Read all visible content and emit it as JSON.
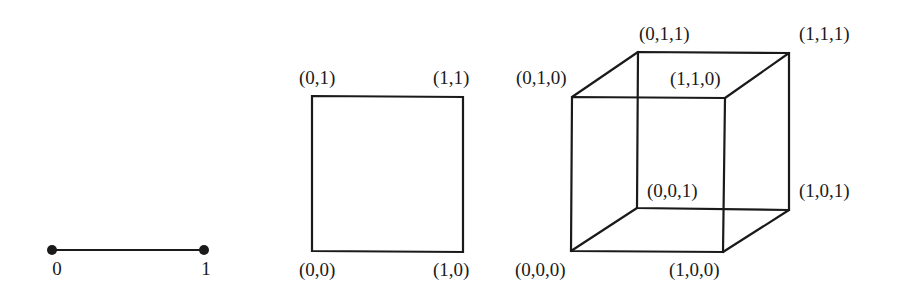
{
  "figures": {
    "line": {
      "vertices": [
        {
          "label": "0",
          "x": 52,
          "y": 250,
          "lx": 56,
          "ly": 272
        },
        {
          "label": "1",
          "x": 204,
          "y": 250,
          "lx": 204,
          "ly": 272
        }
      ]
    },
    "square": {
      "labels": {
        "v00": "(0,0)",
        "v10": "(1,0)",
        "v01": "(0,1)",
        "v11": "(1,1)"
      }
    },
    "cube": {
      "labels": {
        "v000": "(0,0,0)",
        "v100": "(1,0,0)",
        "v010": "(0,1,0)",
        "v110": "(1,1,0)",
        "v001": "(0,0,1)",
        "v101": "(1,0,1)",
        "v011": "(0,1,1)",
        "v111": "(1,1,1)"
      }
    }
  },
  "line_labels": {
    "zero": "0",
    "one": "1"
  }
}
